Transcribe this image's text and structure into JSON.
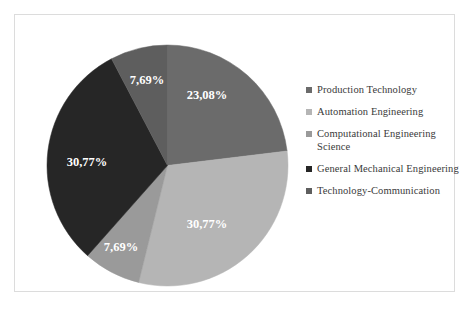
{
  "chart_data": {
    "type": "pie",
    "title": "",
    "subtitle": "",
    "xlabel": "",
    "ylabel": "",
    "grid": false,
    "legend_position": "right",
    "start_angle_deg": 0,
    "direction": "clockwise",
    "categories": [
      "Production Technology",
      "Automation Engineering",
      "Computational Engineering Science",
      "General Mechanical Engineering",
      "Technology-Communication"
    ],
    "values": [
      23.08,
      30.77,
      7.69,
      30.77,
      7.69
    ],
    "data_labels": [
      "23,08%",
      "30,77%",
      "7,69%",
      "30,77%",
      "7,69%"
    ],
    "colors": [
      "#6b6b6b",
      "#b5b5b5",
      "#9a9a9a",
      "#262626",
      "#5e5e5e"
    ],
    "slices": [
      {
        "label": "Production Technology",
        "value": 23.08,
        "display": "23,08%",
        "color": "#6b6b6b",
        "start_deg": 0,
        "end_deg": 83.09,
        "label_x": 172,
        "label_y": 63
      },
      {
        "label": "Automation Engineering",
        "value": 30.77,
        "display": "30,77%",
        "color": "#b5b5b5",
        "start_deg": 83.09,
        "end_deg": 193.86,
        "label_x": 172,
        "label_y": 192
      },
      {
        "label": "Computational Engineering Science",
        "value": 7.69,
        "display": "7,69%",
        "color": "#9a9a9a",
        "start_deg": 193.86,
        "end_deg": 221.54,
        "label_x": 86,
        "label_y": 215
      },
      {
        "label": "General Mechanical Engineering",
        "value": 30.77,
        "display": "30,77%",
        "color": "#262626",
        "start_deg": 221.54,
        "end_deg": 332.31,
        "label_x": 52,
        "label_y": 130
      },
      {
        "label": "Technology-Communication",
        "value": 7.69,
        "display": "7,69%",
        "color": "#5e5e5e",
        "start_deg": 332.31,
        "end_deg": 360,
        "label_x": 112,
        "label_y": 48
      }
    ]
  },
  "legend": {
    "items": [
      {
        "label": "Production Technology",
        "color": "#6b6b6b"
      },
      {
        "label": "Automation Engineering",
        "color": "#b5b5b5"
      },
      {
        "label": "Computational Engineering Science",
        "color": "#9a9a9a"
      },
      {
        "label": "General Mechanical Engineering",
        "color": "#262626"
      },
      {
        "label": "Technology-Communication",
        "color": "#5e5e5e"
      }
    ]
  }
}
